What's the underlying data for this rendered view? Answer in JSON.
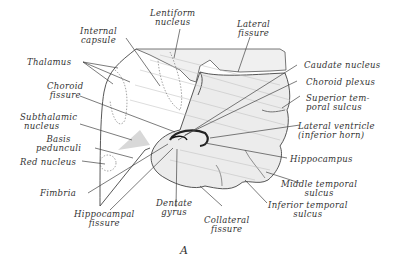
{
  "figure": {
    "panel_label": "A",
    "labels": {
      "internal_capsule": [
        "Internal",
        "capsule"
      ],
      "lentiform_nucleus": [
        "Lentiform",
        "nucleus"
      ],
      "lateral_fissure": [
        "Lateral",
        "fissure"
      ],
      "thalamus": "Thalamus",
      "choroid_fissure": [
        "Choroid",
        "fissure"
      ],
      "subthalamic_nucleus": [
        "Subthalamic",
        "nucleus"
      ],
      "basis_pedunculi": [
        "Basis",
        "pedunculi"
      ],
      "red_nucleus": "Red nucleus",
      "fimbria": "Fimbria",
      "hippocampal_fissure": [
        "Hippocampal",
        "fissure"
      ],
      "dentate_gyrus": [
        "Dentate",
        "gyrus"
      ],
      "collateral_fissure": [
        "Collateral",
        "fissure"
      ],
      "caudate_nucleus": "Caudate nucleus",
      "choroid_plexus": "Choroid plexus",
      "superior_temporal_sulcus": [
        "Superior tem-",
        "poral sulcus"
      ],
      "lateral_ventricle": [
        "Lateral ventricle",
        "(inferior horn)"
      ],
      "hippocampus": "Hippocampus",
      "middle_temporal_sulcus": [
        "Middle temporal",
        "sulcus"
      ],
      "inferior_temporal_sulcus": [
        "Inferior temporal",
        "sulcus"
      ]
    }
  }
}
